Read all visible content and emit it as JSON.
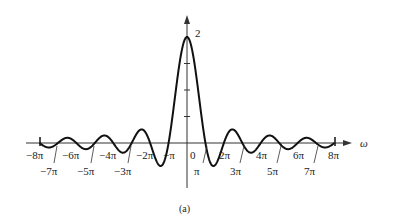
{
  "chart_data": {
    "type": "line",
    "title": "",
    "caption": "(a)",
    "xlabel": "ω",
    "ylabel": "",
    "function": "2 sin(ω)/ω",
    "xlim": [
      -8,
      8
    ],
    "x_unit": "π",
    "ylim": [
      -0.5,
      2
    ],
    "y_tick_label": "2",
    "y_minor_ticks": [
      0.5,
      1.0,
      1.5,
      2.0
    ],
    "x_ticks_upper": [
      "−8π",
      "−6π",
      "−4π",
      "−2π",
      "−π",
      "0",
      "2π",
      "4π",
      "6π",
      "8π"
    ],
    "x_ticks_lower": [
      "−7π",
      "−5π",
      "−3π",
      "π",
      "3π",
      "5π",
      "7π"
    ],
    "zero_crossings_over_pi": [
      -8,
      -7,
      -6,
      -5,
      -4,
      -3,
      -2,
      -1,
      1,
      2,
      3,
      4,
      5,
      6,
      7,
      8
    ],
    "peak": {
      "x": 0,
      "y": 2
    },
    "grid": false,
    "legend": "none"
  },
  "labels": {
    "peak": "2",
    "axis": "ω",
    "caption": "(a)",
    "m8": "−8π",
    "m7": "−7π",
    "m6": "−6π",
    "m5": "−5π",
    "m4": "−4π",
    "m3": "−3π",
    "m2": "−2π",
    "m1": "−π",
    "zero": "0",
    "p1": "π",
    "p2": "2π",
    "p3": "3π",
    "p4": "4π",
    "p5": "5π",
    "p6": "6π",
    "p7": "7π",
    "p8": "8π"
  }
}
